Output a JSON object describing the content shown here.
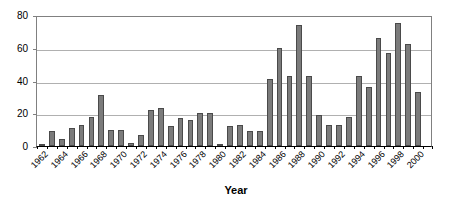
{
  "chart_data": {
    "type": "bar",
    "title": "",
    "xlabel": "Year",
    "ylabel": "",
    "ylim": [
      0,
      80
    ],
    "yticks": [
      0,
      20,
      40,
      60,
      80
    ],
    "grid": "horizontal",
    "legend": "none",
    "bar_color": "#7b7b7b",
    "bar_edge_color": "#4a4a4a",
    "categories": [
      "1962",
      "1963",
      "1964",
      "1965",
      "1966",
      "1967",
      "1968",
      "1969",
      "1970",
      "1971",
      "1972",
      "1973",
      "1974",
      "1975",
      "1976",
      "1977",
      "1978",
      "1979",
      "1980",
      "1981",
      "1982",
      "1983",
      "1984",
      "1985",
      "1986",
      "1987",
      "1988",
      "1989",
      "1990",
      "1991",
      "1992",
      "1993",
      "1994",
      "1995",
      "1996",
      "1997",
      "1998",
      "1999",
      "2000",
      "2001"
    ],
    "values": [
      1,
      9,
      4,
      11,
      13,
      18,
      31,
      10,
      10,
      2,
      7,
      22,
      23,
      12,
      17,
      16,
      20,
      20,
      1,
      12,
      13,
      9,
      9,
      41,
      60,
      43,
      74,
      43,
      19,
      13,
      13,
      18,
      43,
      36,
      66,
      57,
      75,
      62,
      33,
      0
    ],
    "visible_tick_labels": [
      "1962",
      "1964",
      "1966",
      "1968",
      "1970",
      "1972",
      "1974",
      "1976",
      "1978",
      "1980",
      "1982",
      "1984",
      "1986",
      "1988",
      "1990",
      "1992",
      "1994",
      "1996",
      "1998",
      "2000"
    ]
  }
}
